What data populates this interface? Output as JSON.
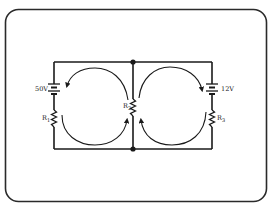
{
  "diagram": {
    "type": "circuit-schematic",
    "colors": {
      "background": "#ffffff",
      "ink": "#1a1a1a",
      "frame": "#2a2a2a"
    },
    "components": {
      "battery_left": {
        "label": "50V"
      },
      "battery_right": {
        "label": "12V"
      },
      "resistor_1": {
        "label": "R",
        "sub": "1"
      },
      "resistor_2": {
        "label": "R",
        "sub": "2"
      },
      "resistor_3": {
        "label": "R",
        "sub": "3"
      }
    },
    "loops": [
      {
        "name": "left-loop",
        "direction": "clockwise"
      },
      {
        "name": "right-loop",
        "direction": "counterclockwise"
      }
    ],
    "junctions": [
      "top-middle",
      "bottom-middle"
    ]
  }
}
